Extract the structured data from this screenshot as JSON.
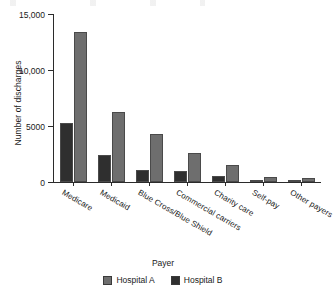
{
  "chart_data": {
    "type": "bar",
    "title": "",
    "xlabel": "Payer",
    "ylabel": "Number of discharges",
    "categories": [
      "Medicare",
      "Medicaid",
      "Blue Cross/Blue Shield",
      "Commercial carriers",
      "Charity care",
      "Self-pay",
      "Other payers"
    ],
    "series": [
      {
        "name": "Hospital A",
        "color": "#6e6e6e",
        "values": [
          13400,
          6250,
          4250,
          2550,
          1500,
          420,
          330
        ]
      },
      {
        "name": "Hospital B",
        "color": "#2f2f2f",
        "values": [
          5300,
          2400,
          1050,
          950,
          550,
          180,
          200
        ]
      }
    ],
    "ylim": [
      0,
      15000
    ],
    "yticks": [
      0,
      5000,
      10000,
      15000
    ],
    "ytick_labels": [
      "0",
      "5000",
      "10,000",
      "15,000"
    ],
    "grid": false,
    "legend_position": "bottom"
  },
  "axes": {
    "y_title": "Number of discharges",
    "x_title": "Payer"
  }
}
